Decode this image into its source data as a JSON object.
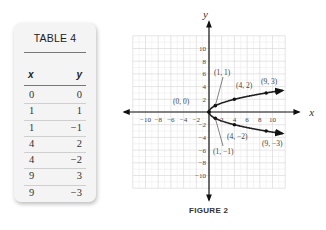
{
  "table": {
    "title": "TABLE 4",
    "headers": [
      "x",
      "y"
    ],
    "rows": [
      {
        "x": "0",
        "y": "0"
      },
      {
        "x": "1",
        "y": "1"
      },
      {
        "x": "1",
        "y": "−1"
      },
      {
        "x": "4",
        "y": "2"
      },
      {
        "x": "4",
        "y": "−2"
      },
      {
        "x": "9",
        "y": "3"
      },
      {
        "x": "9",
        "y": "−3"
      }
    ]
  },
  "figure": {
    "caption": "FIGURE 2",
    "x_axis_label": "x",
    "y_axis_label": "y",
    "x_ticks": [
      "−10",
      "−8",
      "−6",
      "−4",
      "−2",
      "2",
      "4",
      "6",
      "8",
      "10"
    ],
    "y_ticks": [
      "10",
      "8",
      "6",
      "4",
      "2",
      "−2",
      "−4",
      "−6",
      "−8",
      "−10"
    ],
    "point_labels": [
      "(0, 0)",
      "(1, 1)",
      "(4, 2)",
      "(9, 3)",
      "(1, −1)",
      "(4, −2)",
      "(9, −3)"
    ]
  },
  "chart_data": {
    "type": "scatter",
    "title": "FIGURE 2",
    "xlabel": "x",
    "ylabel": "y",
    "xlim": [
      -12,
      12
    ],
    "ylim": [
      -12,
      12
    ],
    "grid": true,
    "series": [
      {
        "name": "upper branch y = √x",
        "points": [
          [
            0,
            0
          ],
          [
            1,
            1
          ],
          [
            4,
            2
          ],
          [
            9,
            3
          ]
        ],
        "curve": "sqrt(x)",
        "extends_to_x": 12,
        "arrow_end": true
      },
      {
        "name": "lower branch y = −√x",
        "points": [
          [
            0,
            0
          ],
          [
            1,
            -1
          ],
          [
            4,
            -2
          ],
          [
            9,
            -3
          ]
        ],
        "curve": "-sqrt(x)",
        "extends_to_x": 12,
        "arrow_end": true
      }
    ],
    "annotations": [
      "(0, 0)",
      "(1, 1)",
      "(4, 2)",
      "(9, 3)",
      "(1, −1)",
      "(4, −2)",
      "(9, −3)"
    ],
    "table": {
      "title": "TABLE 4",
      "columns": [
        "x",
        "y"
      ],
      "rows": [
        [
          0,
          0
        ],
        [
          1,
          1
        ],
        [
          1,
          -1
        ],
        [
          4,
          2
        ],
        [
          4,
          -2
        ],
        [
          9,
          3
        ],
        [
          9,
          -3
        ]
      ]
    }
  }
}
